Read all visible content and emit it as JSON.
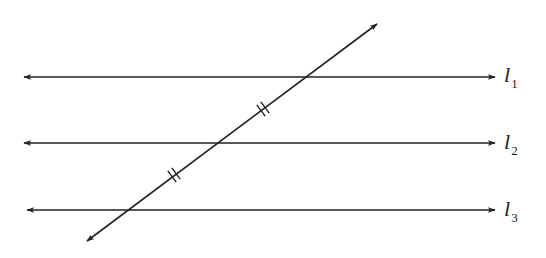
{
  "diagram": {
    "stroke_color": "#222222",
    "background": "#ffffff",
    "parallel_lines": [
      {
        "id": "l1",
        "label": "l",
        "subscript": "1",
        "y": 77,
        "x_start": 24,
        "x_end": 495
      },
      {
        "id": "l2",
        "label": "l",
        "subscript": "2",
        "y": 143,
        "x_start": 24,
        "x_end": 495
      },
      {
        "id": "l3",
        "label": "l",
        "subscript": "3",
        "y": 210,
        "x_start": 27,
        "x_end": 495
      }
    ],
    "transversal": {
      "start": [
        87,
        241
      ],
      "end": [
        377,
        24
      ],
      "intersections": [
        [
          306,
          77
        ],
        [
          218,
          143
        ],
        [
          128,
          210
        ]
      ]
    },
    "congruence_marks": [
      {
        "segment": "l1-l2",
        "position": [
          263,
          109
        ],
        "ticks": 2
      },
      {
        "segment": "l2-l3",
        "position": [
          174,
          175
        ],
        "ticks": 2
      }
    ]
  }
}
